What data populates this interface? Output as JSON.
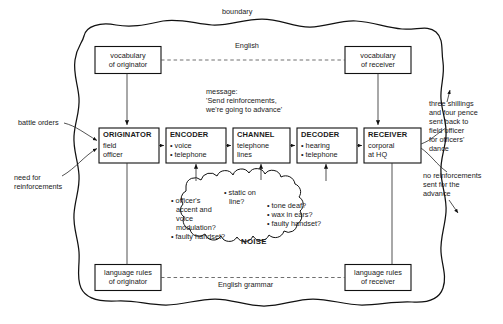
{
  "diagram": {
    "title_label": "boundary",
    "channel_label": "English",
    "grammar_label": "English grammar",
    "noise_label": "NOISE"
  },
  "top_boxes": [
    {
      "line1": "vocabulary",
      "line2": "of originator"
    },
    {
      "line1": "vocabulary",
      "line2": "of receiver"
    }
  ],
  "chain": [
    {
      "heading": "ORIGINATOR",
      "line1": "field",
      "line2": "officer"
    },
    {
      "heading": "ENCODER",
      "line1": "• voice",
      "line2": "• telephone"
    },
    {
      "heading": "CHANNEL",
      "line1": "telephone",
      "line2": "lines"
    },
    {
      "heading": "DECODER",
      "line1": "• hearing",
      "line2": "• telephone"
    },
    {
      "heading": "RECEIVER",
      "line1": "corporal",
      "line2": "at HQ"
    }
  ],
  "bottom_boxes": [
    {
      "line1": "language rules",
      "line2": "of originator"
    },
    {
      "line1": "language rules",
      "line2": "of receiver"
    }
  ],
  "message": {
    "label": "message:",
    "line1": "'Send reinforcements,",
    "line2": "we're going to advance'"
  },
  "left_annotations": [
    {
      "text": "battle orders"
    },
    {
      "line1": "need for",
      "line2": "reinforcements"
    }
  ],
  "right_annotations": [
    {
      "line1": "three shillings",
      "line2": "and four pence",
      "line3": "sent back to",
      "line4": "field officer",
      "line5": "for officers'",
      "line6": "dance"
    },
    {
      "line1": "no reinforcements",
      "line2": "sent for the",
      "line3": "advance"
    }
  ],
  "noise_items": {
    "left": {
      "l1": "• officer's",
      "l2": "accent and",
      "l3": "voice",
      "l4": "modulation?",
      "l5": "• faulty handset?"
    },
    "middle": {
      "l1": "• static on",
      "l2": "line?"
    },
    "right": {
      "l1": "• tone deaf?",
      "l2": "• wax in ears?",
      "l3": "• faulty handset?"
    }
  }
}
